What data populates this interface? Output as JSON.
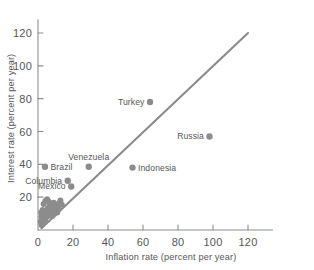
{
  "chart_data": {
    "type": "scatter",
    "title": "",
    "xlabel": "Inflation rate (percent per year)",
    "ylabel": "Interest rate (percent per year)",
    "xlim": [
      0,
      134
    ],
    "ylim": [
      0,
      128
    ],
    "xticks": [
      0,
      20,
      40,
      60,
      80,
      100,
      120
    ],
    "xticklabels": [
      "0",
      "20",
      "40",
      "60",
      "80",
      "100",
      "120"
    ],
    "yticks": [
      20,
      40,
      60,
      80,
      100,
      120
    ],
    "yticklabels": [
      "20",
      "40",
      "60",
      "80",
      "100",
      "120"
    ],
    "grid": false,
    "legend": null,
    "marker_color": "#8c8c8c",
    "line_color": "#8a8a8a",
    "axis_color": "#8e8e8e",
    "text_color": "#55565a",
    "background_color": "#ffffff",
    "trendline": {
      "label": "45-degree reference line",
      "x_start": 2,
      "y_start": 1,
      "x_end": 120,
      "y_end": 120
    },
    "labeled_points": [
      {
        "name": "Turkey",
        "x": 64,
        "y": 78,
        "label": "Turkey",
        "label_side": "left"
      },
      {
        "name": "Russia",
        "x": 98,
        "y": 57,
        "label": "Russia",
        "label_side": "left"
      },
      {
        "name": "Indonesia",
        "x": 54,
        "y": 38,
        "label": "Indonesia",
        "label_side": "right"
      },
      {
        "name": "Venezuela",
        "x": 29,
        "y": 38.5,
        "label": "Venezuela",
        "label_side": "above"
      },
      {
        "name": "Brazil",
        "x": 4,
        "y": 38.5,
        "label": "Brazil",
        "label_side": "right"
      },
      {
        "name": "Columbia",
        "x": 17,
        "y": 30,
        "label": "Columbia",
        "label_side": "left"
      },
      {
        "name": "Mexico",
        "x": 19,
        "y": 26.5,
        "label": "Mexico",
        "label_side": "left"
      }
    ],
    "unlabeled_points": [
      {
        "x": 2.0,
        "y": 3.0
      },
      {
        "x": 2.4,
        "y": 4.2
      },
      {
        "x": 1.6,
        "y": 5.0
      },
      {
        "x": 2.8,
        "y": 5.8
      },
      {
        "x": 2.2,
        "y": 6.6
      },
      {
        "x": 3.4,
        "y": 7.2
      },
      {
        "x": 2.0,
        "y": 8.0
      },
      {
        "x": 3.0,
        "y": 8.8
      },
      {
        "x": 4.0,
        "y": 6.0
      },
      {
        "x": 4.6,
        "y": 7.6
      },
      {
        "x": 3.8,
        "y": 9.4
      },
      {
        "x": 4.8,
        "y": 10.2
      },
      {
        "x": 5.4,
        "y": 8.4
      },
      {
        "x": 5.0,
        "y": 12.0
      },
      {
        "x": 6.0,
        "y": 9.0
      },
      {
        "x": 6.4,
        "y": 11.0
      },
      {
        "x": 5.8,
        "y": 13.4
      },
      {
        "x": 6.8,
        "y": 14.4
      },
      {
        "x": 7.2,
        "y": 10.0
      },
      {
        "x": 7.8,
        "y": 12.6
      },
      {
        "x": 7.0,
        "y": 16.0
      },
      {
        "x": 8.2,
        "y": 8.6
      },
      {
        "x": 8.6,
        "y": 11.4
      },
      {
        "x": 8.0,
        "y": 14.0
      },
      {
        "x": 9.2,
        "y": 9.8
      },
      {
        "x": 9.6,
        "y": 13.0
      },
      {
        "x": 9.0,
        "y": 16.6
      },
      {
        "x": 10.2,
        "y": 11.8
      },
      {
        "x": 10.8,
        "y": 15.0
      },
      {
        "x": 11.4,
        "y": 13.6
      },
      {
        "x": 12.0,
        "y": 16.2
      },
      {
        "x": 12.8,
        "y": 18.0
      },
      {
        "x": 4.2,
        "y": 17.6
      },
      {
        "x": 5.2,
        "y": 18.8
      },
      {
        "x": 3.2,
        "y": 15.8
      },
      {
        "x": 1.8,
        "y": 10.6
      },
      {
        "x": 2.6,
        "y": 12.2
      },
      {
        "x": 6.2,
        "y": 17.2
      },
      {
        "x": 11.0,
        "y": 10.6
      },
      {
        "x": 13.6,
        "y": 15.4
      }
    ]
  }
}
